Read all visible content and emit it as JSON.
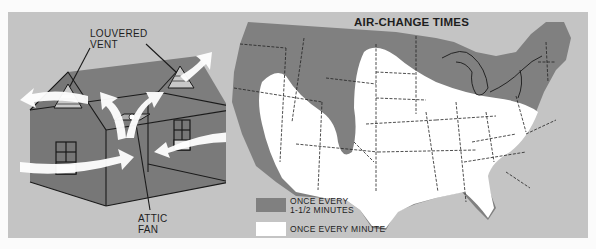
{
  "house_diagram": {
    "labels": {
      "louvered_vent_line1": "LOUVERED",
      "louvered_vent_line2": "VENT",
      "attic_fan_line1": "ATTIC",
      "attic_fan_line2": "FAN"
    },
    "colors": {
      "background": "#c4c4c4",
      "house": "#7b7b7b",
      "airflow": "#ffffff"
    }
  },
  "map": {
    "title": "AIR-CHANGE TIMES",
    "legend": [
      {
        "label_line1": "ONCE EVERY",
        "label_line2": "1-1/2 MINUTES",
        "color": "#808080"
      },
      {
        "label_line1": "ONCE EVERY MINUTE",
        "label_line2": "",
        "color": "#ffffff"
      }
    ],
    "colors": {
      "background": "#c4c4c4",
      "slow_zone": "#808080",
      "fast_zone": "#ffffff"
    }
  }
}
